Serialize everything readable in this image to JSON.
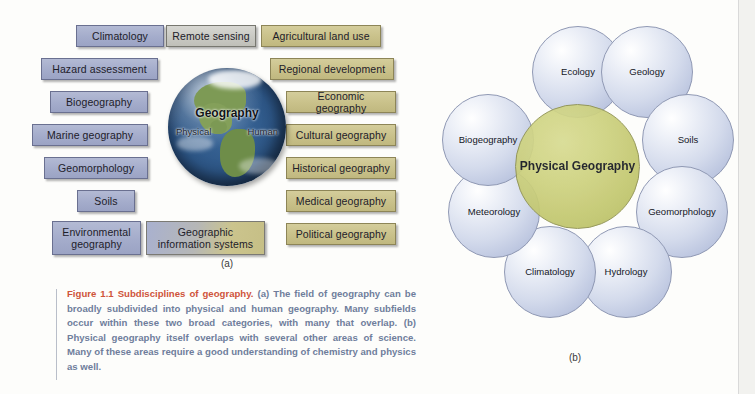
{
  "figure": {
    "panel_a": {
      "label": "(a)",
      "center": {
        "title": "Geography",
        "left_half": "Physical",
        "right_half": "Human"
      },
      "physical_boxes": [
        {
          "label": "Climatology",
          "category": "physical"
        },
        {
          "label": "Hazard assessment",
          "category": "physical"
        },
        {
          "label": "Biogeography",
          "category": "physical"
        },
        {
          "label": "Marine geography",
          "category": "physical"
        },
        {
          "label": "Geomorphology",
          "category": "physical"
        },
        {
          "label": "Soils",
          "category": "physical"
        },
        {
          "label": "Environmental geography",
          "category": "physical"
        }
      ],
      "shared_boxes": [
        {
          "label": "Remote sensing",
          "category": "both"
        },
        {
          "label": "Geographic information systems",
          "category": "both"
        }
      ],
      "human_boxes": [
        {
          "label": "Agricultural land use",
          "category": "human"
        },
        {
          "label": "Regional development",
          "category": "human"
        },
        {
          "label": "Economic geography",
          "category": "human"
        },
        {
          "label": "Cultural geography",
          "category": "human"
        },
        {
          "label": "Historical geography",
          "category": "human"
        },
        {
          "label": "Medical geography",
          "category": "human"
        },
        {
          "label": "Political geography",
          "category": "human"
        }
      ]
    },
    "panel_b": {
      "label": "(b)",
      "core_label": "Physical Geography",
      "petals": [
        {
          "label": "Ecology"
        },
        {
          "label": "Geology"
        },
        {
          "label": "Soils"
        },
        {
          "label": "Geomorphology"
        },
        {
          "label": "Hydrology"
        },
        {
          "label": "Climatology"
        },
        {
          "label": "Meteorology"
        },
        {
          "label": "Biogeography"
        }
      ]
    },
    "caption": {
      "lead": "Figure 1.1 Subdisciplines of geography.",
      "body": " (a) The field of geography can be broadly subdivided into physical and human geography. Many subfields occur within these two broad categories, with many that overlap. (b) Physical geography itself overlaps with several other areas of science. Many of these areas require a good understanding of chemistry and physics as well."
    }
  },
  "colors": {
    "physical_fill": "#a4accb",
    "human_fill": "#c9c18a",
    "shared_fill": "#c9c9c3",
    "petal_fill": "#d4dbec",
    "core_fill": "#cdd17e",
    "caption_lead": "#cf543a",
    "caption_body": "#6f7d9c"
  }
}
